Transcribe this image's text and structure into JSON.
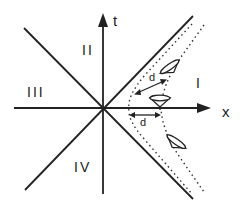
{
  "diagram": {
    "type": "spacetime-diagram",
    "axes": {
      "vertical": "t",
      "horizontal": "x"
    },
    "regions": {
      "r1": "I",
      "r2": "II",
      "r3": "III",
      "r4": "IV"
    },
    "distances": {
      "upper": "d",
      "lower": "d"
    },
    "colors": {
      "line": "#222222",
      "dotted": "#333333",
      "background": "#ffffff"
    }
  }
}
